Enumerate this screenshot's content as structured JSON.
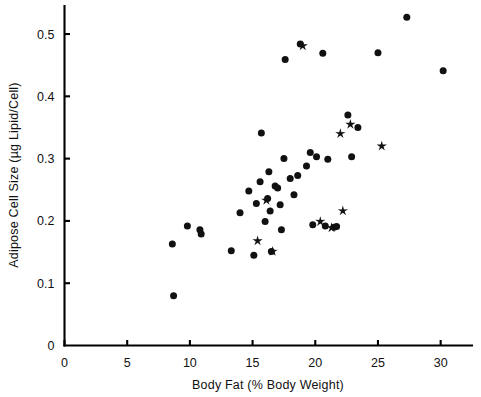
{
  "chart_data": {
    "type": "scatter",
    "title": "",
    "xlabel": "Body Fat (% Body Weight)",
    "ylabel": "Adipose Cell Size (µg Lipid/Cell)",
    "xlim": [
      0,
      32.5
    ],
    "ylim": [
      0,
      0.545
    ],
    "xticks": [
      0,
      5,
      10,
      15,
      20,
      25,
      30
    ],
    "xticklabels": [
      "0",
      "5",
      "10",
      "15",
      "20",
      "25",
      "30"
    ],
    "yticks": [
      0,
      0.1,
      0.2,
      0.3,
      0.4,
      0.5
    ],
    "yticklabels": [
      "0",
      "0.1",
      "0.2",
      "0.3",
      "0.4",
      "0.5"
    ],
    "grid": false,
    "legend": "none",
    "series": [
      {
        "name": "circle",
        "marker": "circle",
        "color": "#111111",
        "points": [
          [
            8.7,
            0.08
          ],
          [
            8.6,
            0.163
          ],
          [
            9.8,
            0.192
          ],
          [
            10.8,
            0.186
          ],
          [
            10.9,
            0.179
          ],
          [
            13.3,
            0.152
          ],
          [
            14.0,
            0.213
          ],
          [
            14.7,
            0.248
          ],
          [
            15.1,
            0.145
          ],
          [
            15.3,
            0.228
          ],
          [
            15.6,
            0.263
          ],
          [
            15.7,
            0.341
          ],
          [
            16.0,
            0.199
          ],
          [
            16.2,
            0.236
          ],
          [
            16.3,
            0.279
          ],
          [
            16.4,
            0.216
          ],
          [
            16.5,
            0.151
          ],
          [
            16.8,
            0.256
          ],
          [
            17.0,
            0.253
          ],
          [
            17.2,
            0.226
          ],
          [
            17.3,
            0.186
          ],
          [
            17.5,
            0.3
          ],
          [
            17.6,
            0.459
          ],
          [
            18.0,
            0.268
          ],
          [
            18.3,
            0.242
          ],
          [
            18.6,
            0.273
          ],
          [
            18.8,
            0.484
          ],
          [
            19.3,
            0.288
          ],
          [
            19.6,
            0.31
          ],
          [
            19.8,
            0.194
          ],
          [
            20.1,
            0.303
          ],
          [
            20.6,
            0.469
          ],
          [
            20.8,
            0.192
          ],
          [
            21.0,
            0.299
          ],
          [
            21.5,
            0.19
          ],
          [
            21.7,
            0.191
          ],
          [
            22.6,
            0.37
          ],
          [
            22.9,
            0.303
          ],
          [
            23.4,
            0.35
          ],
          [
            25.0,
            0.47
          ],
          [
            27.3,
            0.527
          ],
          [
            30.2,
            0.441
          ]
        ]
      },
      {
        "name": "star",
        "marker": "star",
        "color": "#111111",
        "points": [
          [
            15.4,
            0.168
          ],
          [
            16.1,
            0.233
          ],
          [
            16.6,
            0.151
          ],
          [
            19.0,
            0.481
          ],
          [
            20.4,
            0.199
          ],
          [
            21.3,
            0.189
          ],
          [
            22.0,
            0.34
          ],
          [
            22.2,
            0.216
          ],
          [
            22.8,
            0.355
          ],
          [
            25.3,
            0.32
          ]
        ]
      }
    ]
  }
}
